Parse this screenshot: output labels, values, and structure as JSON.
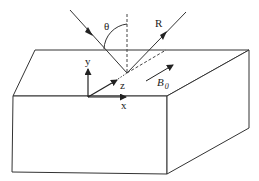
{
  "figure": {
    "labels": {
      "theta": "θ",
      "reflected": "R",
      "y_axis": "y",
      "x_axis": "x",
      "z_axis": "z",
      "field": "B",
      "field_subscript": "0"
    },
    "colors": {
      "line": "#333333",
      "background": "#ffffff"
    }
  }
}
